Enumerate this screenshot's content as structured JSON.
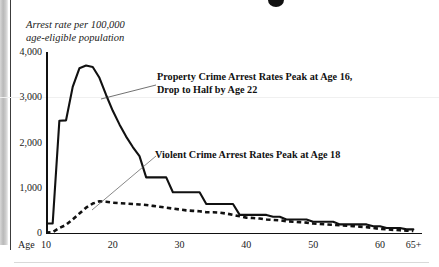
{
  "figure": {
    "y_axis_caption_line1": "Arrest rate per 100,000",
    "y_axis_caption_line2": "age-eligible population",
    "x_axis_name": "Age"
  },
  "annotations": {
    "property_line1": "Property Crime Arrest Rates Peak at Age 16,",
    "property_line2": "Drop to Half by Age 22",
    "violent_line1": "Violent Crime Arrest Rates Peak at Age 18"
  },
  "chart_data": {
    "type": "line",
    "title": "",
    "xlabel": "Age",
    "ylabel": "Arrest rate per 100,000 age-eligible population",
    "xlim": [
      10,
      66
    ],
    "ylim": [
      0,
      4000
    ],
    "grid": false,
    "legend": "annotations-inline",
    "ytick_labels": [
      "0",
      "1,000",
      "2,000",
      "3,000",
      "4,000"
    ],
    "ytick_values": [
      0,
      1000,
      2000,
      3000,
      4000
    ],
    "xtick_labels": [
      "10",
      "20",
      "30",
      "40",
      "50",
      "60",
      "65+"
    ],
    "xtick_values": [
      10,
      20,
      30,
      40,
      50,
      60,
      65
    ],
    "x": [
      10,
      11,
      12,
      13,
      14,
      15,
      16,
      17,
      18,
      19,
      20,
      21,
      22,
      23,
      24,
      25,
      26,
      27,
      28,
      29,
      30,
      31,
      32,
      33,
      34,
      35,
      36,
      37,
      38,
      39,
      40,
      41,
      42,
      43,
      44,
      45,
      46,
      47,
      48,
      49,
      50,
      51,
      52,
      53,
      54,
      55,
      56,
      57,
      58,
      59,
      60,
      61,
      62,
      63,
      64,
      65
    ],
    "series": [
      {
        "name": "Property Crime Arrest Rates",
        "style": "solid",
        "color": "#111111",
        "values": [
          210,
          210,
          2480,
          2490,
          3230,
          3640,
          3700,
          3670,
          3430,
          3050,
          2700,
          2400,
          2130,
          1900,
          1700,
          1230,
          1230,
          1230,
          1230,
          900,
          900,
          900,
          900,
          900,
          640,
          640,
          640,
          640,
          640,
          400,
          400,
          400,
          400,
          400,
          360,
          360,
          300,
          300,
          300,
          300,
          250,
          250,
          250,
          250,
          190,
          190,
          190,
          190,
          190,
          150,
          150,
          110,
          110,
          110,
          80,
          80
        ]
      },
      {
        "name": "Violent Crime Arrest Rates",
        "style": "dashed",
        "color": "#111111",
        "values": [
          10,
          20,
          110,
          180,
          300,
          430,
          560,
          650,
          700,
          690,
          670,
          660,
          650,
          640,
          630,
          620,
          600,
          580,
          560,
          540,
          520,
          500,
          490,
          480,
          460,
          460,
          450,
          430,
          400,
          370,
          340,
          330,
          320,
          300,
          290,
          280,
          260,
          250,
          240,
          230,
          210,
          200,
          190,
          180,
          170,
          160,
          150,
          140,
          130,
          110,
          90,
          80,
          70,
          60,
          50,
          45
        ]
      }
    ]
  }
}
